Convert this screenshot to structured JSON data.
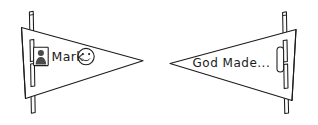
{
  "illustration": {
    "title": "Two pennant flags on poles",
    "style": "hand-drawn black line art on white",
    "ink_color": "#1b1b1b",
    "background_color": "#ffffff"
  },
  "left_pennant": {
    "name": "left-pennant",
    "direction": "points right",
    "badge_icon": "person-badge-icon",
    "label": "Mark",
    "emoji_icon": "smiley-face-icon",
    "pole": {
      "name": "left-flag-pole",
      "segments": 2,
      "top_segment_label": "upper pole segment",
      "bottom_segment_label": "lower pole segment"
    }
  },
  "right_pennant": {
    "name": "right-pennant",
    "direction": "points left",
    "label": "God Made...",
    "slot_icon": "vertical-rounded-slot-icon",
    "pole": {
      "name": "right-flag-pole",
      "segments": 2,
      "top_segment_label": "upper pole segment",
      "bottom_segment_label": "lower pole segment"
    }
  }
}
